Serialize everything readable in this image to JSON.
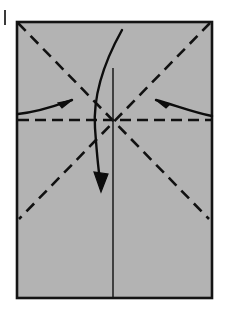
{
  "canvas": {
    "width": 225,
    "height": 327,
    "background": "#ffffff"
  },
  "figure": {
    "kind": "origami-fold-diagram",
    "title": "Origami step: rectangle with pre-creased diagonals and center lines",
    "paper": {
      "label": "paper-sheet",
      "x": 17,
      "y": 22,
      "width": 195,
      "height": 276,
      "fill": "#b3b3b3",
      "stroke": "#141414",
      "stroke_width": 2.6
    },
    "center_point": {
      "x": 113,
      "y": 120
    },
    "crease_lines": [
      {
        "name": "diagonal-crease-tl-br",
        "style": "dashed",
        "x1": 18,
        "y1": 23,
        "x2": 209,
        "y2": 219,
        "stroke": "#111111",
        "stroke_width": 2.6,
        "dash": "11 7"
      },
      {
        "name": "diagonal-crease-tr-bl",
        "style": "dashed",
        "x1": 210,
        "y1": 23,
        "x2": 19,
        "y2": 219,
        "stroke": "#111111",
        "stroke_width": 2.6,
        "dash": "11 7"
      },
      {
        "name": "horizontal-crease",
        "style": "dashed",
        "x1": 18,
        "y1": 120,
        "x2": 211,
        "y2": 120,
        "stroke": "#111111",
        "stroke_width": 2.6,
        "dash": "11 6"
      },
      {
        "name": "vertical-center-line",
        "style": "solid",
        "x1": 113,
        "y1": 68,
        "x2": 113,
        "y2": 297,
        "stroke": "#1a1a1a",
        "stroke_width": 1.5
      }
    ],
    "arrows": [
      {
        "name": "left-push-arrow",
        "direction": "right",
        "path": "M 18 114 C 40 112, 58 105, 72 100",
        "head": "M 72 100 L 58 103 L 62 108 Z",
        "stroke": "#0d0d0d",
        "stroke_width": 2.4
      },
      {
        "name": "right-push-arrow",
        "direction": "left",
        "path": "M 212 116 C 192 112, 172 104, 156 100",
        "head": "M 156 100 L 170 104 L 166 108 Z",
        "stroke": "#0d0d0d",
        "stroke_width": 2.4
      },
      {
        "name": "fold-down-curved-arrow",
        "direction": "down",
        "path": "M 122 30 C 103 64, 93 98, 95 128 C 97 156, 99 176, 101 186",
        "head": "M 101 192 L 94 172 L 108 174 Z",
        "stroke": "#0d0d0d",
        "stroke_width": 2.4
      }
    ],
    "page_mark": {
      "name": "left-margin-tick",
      "x": 4,
      "y": 10,
      "width": 2,
      "height": 15,
      "color": "#3a3a3a"
    }
  },
  "colors": {
    "paper_fill": "#b3b3b3",
    "ink": "#111111",
    "background": "#ffffff"
  }
}
